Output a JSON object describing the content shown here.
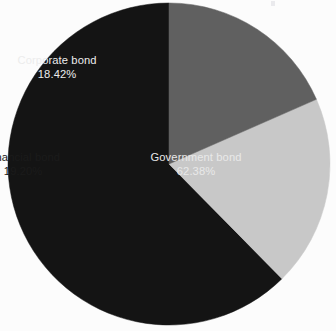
{
  "chart_data": {
    "type": "pie",
    "title": "",
    "subtitle": "",
    "xlabel": "",
    "ylabel": "",
    "legend_position": "none",
    "grid": false,
    "labels_inside_slices": true,
    "value_unit": "%",
    "start_angle_deg": 90,
    "direction": "counterclockwise",
    "categories": [
      "Government bond",
      "Financial bond",
      "Corporate bond"
    ],
    "values": [
      62.38,
      19.2,
      18.42
    ],
    "slices": [
      {
        "name": "Government bond",
        "value": 62.38,
        "value_label": "62.38%",
        "color": "#141414",
        "text_color": "#e8e8e8"
      },
      {
        "name": "Financial bond",
        "value": 19.2,
        "value_label": "19.20%",
        "color": "#c8c8c8",
        "text_color": "#1b1b1b"
      },
      {
        "name": "Corporate bond",
        "value": 18.42,
        "value_label": "18.42%",
        "color": "#606060",
        "text_color": "#ececec"
      }
    ]
  },
  "figure": {
    "background_color": "#fcfcfc",
    "center_x": 169,
    "center_y": 164,
    "radius": 161
  },
  "labels": {
    "government": {
      "name": "Government bond",
      "value": "62.38%"
    },
    "financial": {
      "name": "Financial bond",
      "value": "19.20%"
    },
    "corporate": {
      "name": "Corporate bond",
      "value": "18.42%"
    }
  }
}
